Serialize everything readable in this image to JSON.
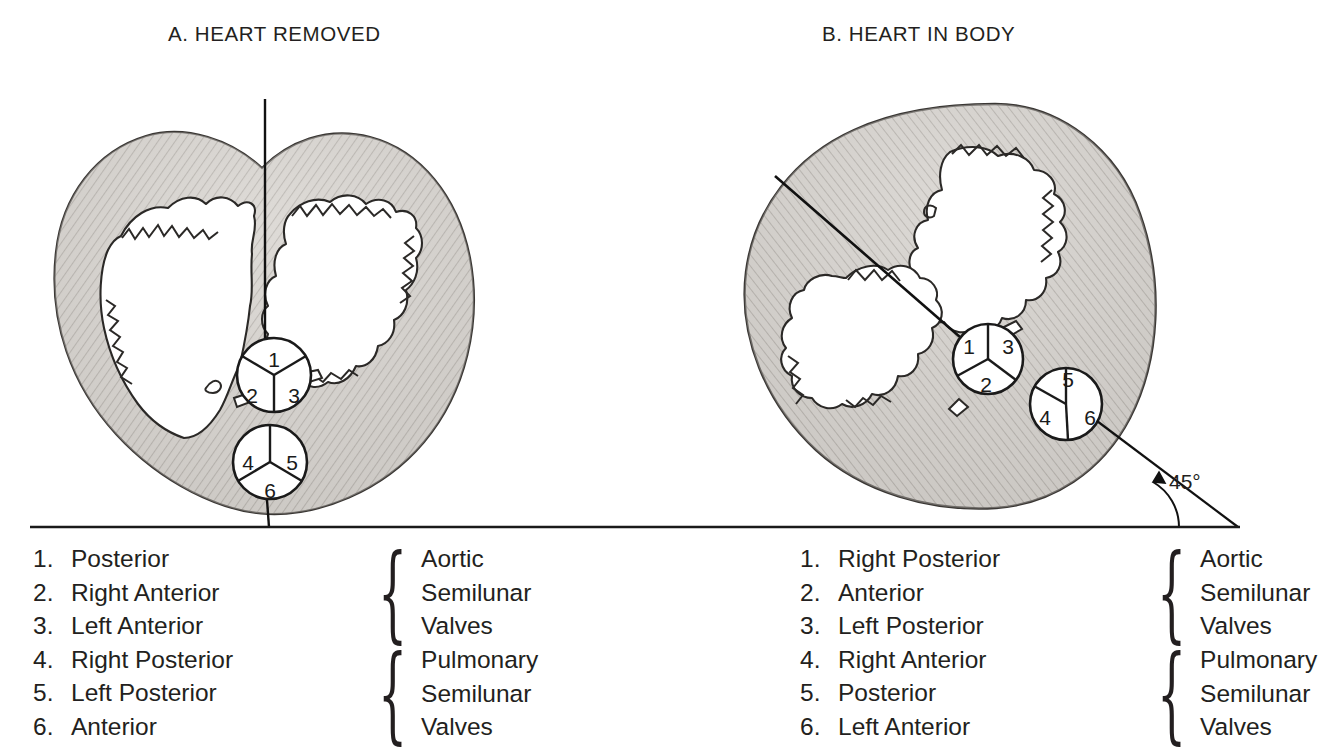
{
  "figure": {
    "panels": [
      {
        "id": "a",
        "title": "A. HEART REMOVED",
        "reference_line": "vertical",
        "valves": {
          "aortic": {
            "cusps": [
              "1",
              "2",
              "3"
            ]
          },
          "pulmonary": {
            "cusps": [
              "4",
              "5",
              "6"
            ]
          }
        },
        "legend": [
          {
            "num": "1.",
            "label": "Posterior"
          },
          {
            "num": "2.",
            "label": "Right Anterior"
          },
          {
            "num": "3.",
            "label": "Left Anterior"
          },
          {
            "num": "4.",
            "label": "Right Posterior"
          },
          {
            "num": "5.",
            "label": "Left Posterior"
          },
          {
            "num": "6.",
            "label": "Anterior"
          }
        ],
        "braces": {
          "aortic": {
            "glyph": "{",
            "line1": "Aortic",
            "line2": "Semilunar",
            "line3": "Valves"
          },
          "pulmonary": {
            "glyph": "{",
            "line1": "Pulmonary",
            "line2": "Semilunar",
            "line3": "Valves"
          }
        }
      },
      {
        "id": "b",
        "title": "B. HEART IN BODY",
        "reference_line": "diagonal",
        "angle_label": "45°",
        "valves": {
          "aortic": {
            "cusps": [
              "1",
              "3",
              "2"
            ]
          },
          "pulmonary": {
            "cusps": [
              "5",
              "4",
              "6"
            ]
          }
        },
        "legend": [
          {
            "num": "1.",
            "label": "Right Posterior"
          },
          {
            "num": "2.",
            "label": "Anterior"
          },
          {
            "num": "3.",
            "label": "Left Posterior"
          },
          {
            "num": "4.",
            "label": "Right Anterior"
          },
          {
            "num": "5.",
            "label": "Posterior"
          },
          {
            "num": "6.",
            "label": "Left Anterior"
          }
        ],
        "braces": {
          "aortic": {
            "glyph": "{",
            "line1": "Aortic",
            "line2": "Semilunar",
            "line3": "Valves"
          },
          "pulmonary": {
            "glyph": "{",
            "line1": "Pulmonary",
            "line2": "Semilunar",
            "line3": "Valves"
          }
        }
      }
    ],
    "colors": {
      "ink": "#231f20",
      "myocardium_fill": "#c9c6c2",
      "myocardium_light": "#e0ddd9",
      "background": "#ffffff",
      "baseline": "#1a1a1a"
    }
  }
}
